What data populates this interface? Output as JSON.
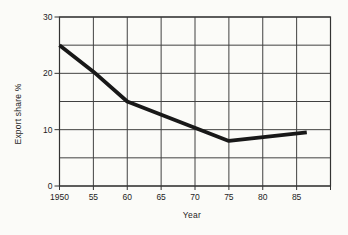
{
  "figure": {
    "background": "#fbfbf8"
  },
  "chart_data": {
    "type": "line",
    "title": "",
    "xlabel": "Year",
    "ylabel": "Export share %",
    "xlim": [
      1950,
      1990
    ],
    "ylim": [
      0,
      30
    ],
    "grid": true,
    "x_grid_step": 5,
    "y_grid_step": 5,
    "legend": "none",
    "x_ticks": [
      {
        "value": 1950,
        "label": "1950"
      },
      {
        "value": 1955,
        "label": "55"
      },
      {
        "value": 1960,
        "label": "60"
      },
      {
        "value": 1965,
        "label": "65"
      },
      {
        "value": 1970,
        "label": "70"
      },
      {
        "value": 1975,
        "label": "75"
      },
      {
        "value": 1980,
        "label": "80"
      },
      {
        "value": 1985,
        "label": "85"
      }
    ],
    "y_ticks": [
      {
        "value": 0,
        "label": "0"
      },
      {
        "value": 10,
        "label": "10"
      },
      {
        "value": 20,
        "label": "20"
      },
      {
        "value": 30,
        "label": "30"
      }
    ],
    "series": [
      {
        "name": "Export share",
        "points": [
          [
            1950,
            25
          ],
          [
            1955,
            20.3
          ],
          [
            1960,
            15
          ],
          [
            1975,
            8
          ],
          [
            1986.5,
            9.5
          ]
        ]
      }
    ],
    "line_color": "#181818",
    "grid_color": "#414141",
    "axis_color": "#333333"
  }
}
